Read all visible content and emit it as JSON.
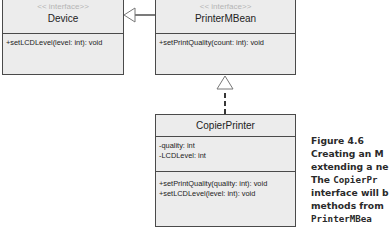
{
  "diagram": {
    "type": "uml-class-diagram",
    "classes": [
      {
        "id": "device",
        "stereotype": "<< interface>>",
        "name": "Device",
        "attributes": [],
        "methods": [
          "+setLCDLevel(level: int): void"
        ]
      },
      {
        "id": "pmbean",
        "stereotype": "<< interface>>",
        "name": "PrinterMBean",
        "attributes": [],
        "methods": [
          "+setPrintQuality(count: int): void"
        ]
      },
      {
        "id": "copier",
        "stereotype": "",
        "name": "CopierPrinter",
        "attributes": [
          "-quality: int",
          "-LCDLevel: int"
        ],
        "methods": [
          "+setPrintQuality(quality: int): void",
          "+setLCDLevel(level: int): void"
        ]
      }
    ],
    "relations": [
      {
        "from": "PrinterMBean",
        "to": "Device",
        "kind": "generalization",
        "style": "solid"
      },
      {
        "from": "CopierPrinter",
        "to": "PrinterMBean",
        "kind": "realization",
        "style": "dashed"
      }
    ],
    "colors": {
      "box_fill": "#ececec",
      "border": "#4a4a4a",
      "stereotype_text": "#b5b5b5",
      "text": "#222222"
    }
  },
  "caption": {
    "figure": "Figure 4.6",
    "line1": "Creating an M",
    "line2": "extending a ne",
    "line3_prefix": "The ",
    "line3_code": "CopierPr",
    "line4": "interface will b",
    "line5": "methods from",
    "line6_code": "PrinterMBea"
  }
}
